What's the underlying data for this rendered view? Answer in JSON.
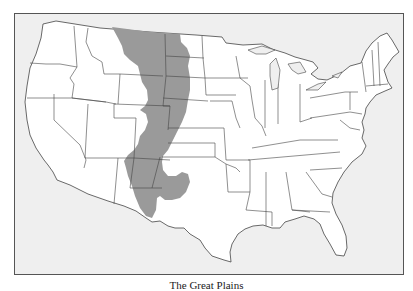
{
  "map": {
    "title": "The Great Plains",
    "region_label": "Great Plains",
    "colors": {
      "ocean": "#efefef",
      "land": "#ffffff",
      "highlight": "#9a9a9a",
      "border": "#444444",
      "frame": "#555555"
    }
  }
}
